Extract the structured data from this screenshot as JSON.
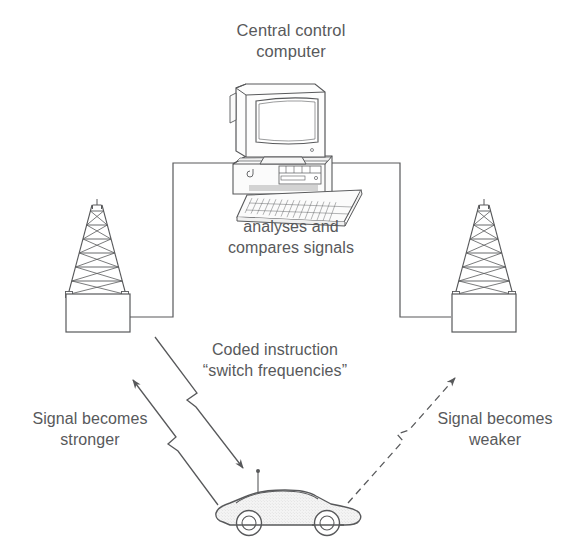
{
  "diagram": {
    "title_note": "cellular-network handover schematic",
    "background_color": "#ffffff",
    "stroke_color": "#58595b",
    "text_color": "#58595b",
    "fill_color": "#f2f2f2"
  },
  "labels": {
    "central_control": "Central control\ncomputer",
    "analyses": "analyses and\ncompares signals",
    "coded_instruction": "Coded instruction\n“switch frequencies”",
    "signal_stronger": "Signal becomes\nstronger",
    "signal_weaker": "Signal becomes\nweaker"
  },
  "nodes": {
    "computer": {
      "name": "central control computer",
      "parts": [
        "crt-monitor",
        "desktop-case",
        "keyboard",
        "floppy-drive"
      ]
    },
    "left_mast": {
      "name": "left transmitter mast",
      "parts": [
        "lattice-tower",
        "base-building"
      ]
    },
    "right_mast": {
      "name": "right transmitter mast",
      "parts": [
        "lattice-tower",
        "base-building"
      ]
    },
    "car": {
      "name": "car with roof antenna",
      "parts": [
        "body",
        "front-wheel",
        "rear-wheel",
        "antenna"
      ]
    }
  },
  "connections": [
    {
      "from": "computer",
      "to": "left_mast",
      "style": "solid-cable"
    },
    {
      "from": "computer",
      "to": "right_mast",
      "style": "solid-cable"
    },
    {
      "from": "car",
      "to": "left_mast",
      "style": "solid-arrow",
      "label": "signal_stronger"
    },
    {
      "from": "left_mast",
      "to": "car",
      "style": "solid-arrow",
      "label": "coded_instruction"
    },
    {
      "from": "car",
      "to": "right_mast",
      "style": "dashed-arrow",
      "label": "signal_weaker"
    }
  ]
}
